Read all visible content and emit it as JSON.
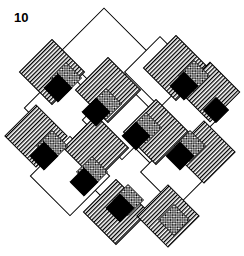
{
  "figure": {
    "label": "10",
    "title": "10",
    "kind": "quilt-block-diagram",
    "canvas": {
      "width": 244,
      "height": 256,
      "background": "#ffffff"
    }
  },
  "palette": {
    "outline": "#000000",
    "plain": "#ffffff",
    "solid": "#000000",
    "stripe_line": "#000000",
    "crosshatch_line": "#000000",
    "crosshatch_field": "#ffffff"
  },
  "legend": {
    "fills": [
      {
        "name": "plain",
        "label": "Plain (white)",
        "color": "#ffffff"
      },
      {
        "name": "striped",
        "label": "Vertical stripe",
        "color": "#000000"
      },
      {
        "name": "crosshatch",
        "label": "Cross hatch",
        "color": "#000000"
      },
      {
        "name": "solid",
        "label": "Solid black",
        "color": "#000000"
      }
    ]
  },
  "geometry": {
    "rotation_deg": 45,
    "unit": 44,
    "origin": {
      "x": 76,
      "y": 16
    },
    "note": "Diagonal lattice of 45-degree rotated squares forming a woven band pattern."
  },
  "chart_data": {
    "type": "table",
    "title": "10",
    "xlabel": "",
    "ylabel": "",
    "categories": [
      "plain",
      "striped",
      "crosshatch",
      "solid"
    ],
    "values": [
      13,
      14,
      11,
      11
    ],
    "tiles": [
      {
        "id": "p1",
        "fill": "plain",
        "cx": 104,
        "cy": 52,
        "size": 62,
        "rot": 45
      },
      {
        "id": "p2",
        "fill": "plain",
        "cx": 160,
        "cy": 72,
        "size": 50,
        "rot": 45
      },
      {
        "id": "p3",
        "fill": "plain",
        "cx": 64,
        "cy": 108,
        "size": 56,
        "rot": 45
      },
      {
        "id": "p4",
        "fill": "plain",
        "cx": 122,
        "cy": 120,
        "size": 56,
        "rot": 45
      },
      {
        "id": "p5",
        "fill": "plain",
        "cx": 184,
        "cy": 116,
        "size": 52,
        "rot": 45
      },
      {
        "id": "p6",
        "fill": "plain",
        "cx": 70,
        "cy": 176,
        "size": 56,
        "rot": 45
      },
      {
        "id": "p7",
        "fill": "plain",
        "cx": 130,
        "cy": 184,
        "size": 58,
        "rot": 45
      },
      {
        "id": "p8",
        "fill": "plain",
        "cx": 176,
        "cy": 172,
        "size": 50,
        "rot": 45
      },
      {
        "id": "s1",
        "fill": "striped",
        "cx": 52,
        "cy": 72,
        "size": 46,
        "rot": 45
      },
      {
        "id": "s2",
        "fill": "striped",
        "cx": 108,
        "cy": 90,
        "size": 46,
        "rot": 45
      },
      {
        "id": "s3",
        "fill": "striped",
        "cx": 176,
        "cy": 68,
        "size": 46,
        "rot": 45
      },
      {
        "id": "s4",
        "fill": "striped",
        "cx": 210,
        "cy": 92,
        "size": 42,
        "rot": 45
      },
      {
        "id": "s5",
        "fill": "striped",
        "cx": 36,
        "cy": 136,
        "size": 44,
        "rot": 45
      },
      {
        "id": "s6",
        "fill": "striped",
        "cx": 96,
        "cy": 148,
        "size": 46,
        "rot": 45
      },
      {
        "id": "s7",
        "fill": "striped",
        "cx": 156,
        "cy": 132,
        "size": 46,
        "rot": 45
      },
      {
        "id": "s8",
        "fill": "striped",
        "cx": 204,
        "cy": 152,
        "size": 44,
        "rot": 45
      },
      {
        "id": "s9",
        "fill": "striped",
        "cx": 116,
        "cy": 212,
        "size": 46,
        "rot": 45
      },
      {
        "id": "s10",
        "fill": "striped",
        "cx": 168,
        "cy": 216,
        "size": 44,
        "rot": 45
      },
      {
        "id": "c1",
        "fill": "crosshatch",
        "cx": 66,
        "cy": 78,
        "size": 22,
        "rot": 45
      },
      {
        "id": "c2",
        "fill": "crosshatch",
        "cx": 106,
        "cy": 104,
        "size": 22,
        "rot": 45
      },
      {
        "id": "c3",
        "fill": "crosshatch",
        "cx": 146,
        "cy": 128,
        "size": 22,
        "rot": 45
      },
      {
        "id": "c4",
        "fill": "crosshatch",
        "cx": 194,
        "cy": 76,
        "size": 22,
        "rot": 45
      },
      {
        "id": "c5",
        "fill": "crosshatch",
        "cx": 52,
        "cy": 146,
        "size": 22,
        "rot": 45
      },
      {
        "id": "c6",
        "fill": "crosshatch",
        "cx": 92,
        "cy": 172,
        "size": 22,
        "rot": 45
      },
      {
        "id": "c7",
        "fill": "crosshatch",
        "cx": 190,
        "cy": 146,
        "size": 22,
        "rot": 45
      },
      {
        "id": "c8",
        "fill": "crosshatch",
        "cx": 128,
        "cy": 200,
        "size": 22,
        "rot": 45
      },
      {
        "id": "c9",
        "fill": "crosshatch",
        "cx": 174,
        "cy": 220,
        "size": 22,
        "rot": 45
      },
      {
        "id": "b1",
        "fill": "solid",
        "cx": 58,
        "cy": 88,
        "size": 20,
        "rot": 45
      },
      {
        "id": "b2",
        "fill": "solid",
        "cx": 96,
        "cy": 112,
        "size": 20,
        "rot": 45
      },
      {
        "id": "b3",
        "fill": "solid",
        "cx": 136,
        "cy": 136,
        "size": 20,
        "rot": 45
      },
      {
        "id": "b4",
        "fill": "solid",
        "cx": 184,
        "cy": 86,
        "size": 20,
        "rot": 45
      },
      {
        "id": "b5",
        "fill": "solid",
        "cx": 216,
        "cy": 110,
        "size": 18,
        "rot": 45
      },
      {
        "id": "b6",
        "fill": "solid",
        "cx": 44,
        "cy": 156,
        "size": 20,
        "rot": 45
      },
      {
        "id": "b7",
        "fill": "solid",
        "cx": 84,
        "cy": 182,
        "size": 20,
        "rot": 45
      },
      {
        "id": "b8",
        "fill": "solid",
        "cx": 180,
        "cy": 156,
        "size": 20,
        "rot": 45
      },
      {
        "id": "b9",
        "fill": "solid",
        "cx": 120,
        "cy": 208,
        "size": 20,
        "rot": 45
      }
    ]
  }
}
